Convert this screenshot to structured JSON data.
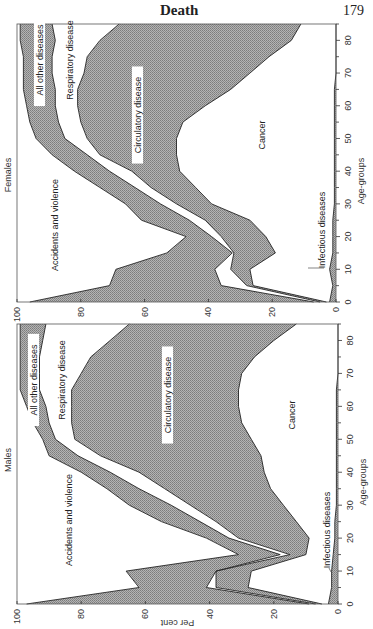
{
  "page": {
    "running_title": "Death",
    "page_number": "179"
  },
  "colors": {
    "hatch": "#9a9a9a",
    "line": "#222222",
    "background": "#ffffff"
  },
  "chart_data": [
    {
      "type": "area",
      "title": "Females",
      "xlabel": "Age-groups",
      "ylabel": "Per cent",
      "orientation": "rotated-90",
      "x_ticks": [
        0,
        10,
        20,
        30,
        40,
        50,
        60,
        70,
        80
      ],
      "y_ticks": [
        0,
        20,
        40,
        60,
        80,
        100
      ],
      "xlim": [
        0,
        85
      ],
      "ylim": [
        0,
        100
      ],
      "x": [
        0,
        5,
        10,
        15,
        20,
        25,
        30,
        35,
        40,
        45,
        50,
        55,
        60,
        65,
        70,
        75,
        80,
        85
      ],
      "stack_order_bottom_to_top": [
        "Infectious diseases",
        "Cancer",
        "Circulatory disease",
        "Respiratory disease",
        "All other diseases",
        "Accidents and violence"
      ],
      "cumulative_boundaries": [
        {
          "name": "Infectious diseases",
          "shaded": true,
          "label_pos": "bottom-callout",
          "top": [
            2,
            1,
            2,
            1,
            1,
            1,
            0.5,
            0.5,
            0.5,
            0.5,
            0.5,
            0.5,
            0.5,
            0.5,
            0,
            0,
            0,
            0
          ]
        },
        {
          "name": "Cancer",
          "shaded": false,
          "top": [
            3,
            26,
            27,
            19,
            22,
            27,
            39,
            44,
            49,
            50,
            50,
            48,
            41,
            33,
            27,
            21,
            14,
            11
          ]
        },
        {
          "name": "Circulatory disease",
          "shaded": true,
          "top": [
            5,
            28,
            33,
            32,
            36,
            41,
            50,
            58,
            64,
            74,
            78,
            80,
            81,
            81,
            79,
            78,
            74,
            68
          ]
        },
        {
          "name": "Respiratory disease",
          "shaded": false,
          "top": [
            7,
            36,
            38,
            32.5,
            39,
            46,
            55,
            63,
            71,
            78,
            85,
            87,
            88,
            88,
            89,
            89,
            88,
            89
          ]
        },
        {
          "name": "All other diseases",
          "shaded": true,
          "top": [
            96,
            71,
            69,
            53,
            47,
            61,
            66,
            74,
            82,
            89,
            94,
            96,
            97,
            98,
            98,
            98,
            99,
            99
          ]
        },
        {
          "name": "Accidents and violence",
          "shaded": false,
          "top": [
            100,
            100,
            100,
            100,
            100,
            100,
            100,
            100,
            100,
            100,
            100,
            100,
            100,
            100,
            100,
            100,
            100,
            100
          ]
        }
      ]
    },
    {
      "type": "area",
      "title": "Males",
      "xlabel": "Age-groups",
      "ylabel": "Per cent",
      "orientation": "rotated-90",
      "x_ticks": [
        0,
        10,
        20,
        30,
        40,
        50,
        60,
        70,
        80
      ],
      "y_ticks": [
        0,
        20,
        40,
        60,
        80,
        100
      ],
      "xlim": [
        0,
        85
      ],
      "ylim": [
        0,
        100
      ],
      "x": [
        0,
        5,
        10,
        15,
        20,
        25,
        30,
        35,
        40,
        45,
        50,
        55,
        60,
        65,
        70,
        75,
        80,
        85
      ],
      "stack_order_bottom_to_top": [
        "Infectious diseases",
        "Cancer",
        "Circulatory disease",
        "Respiratory disease",
        "All other diseases",
        "Accidents and violence"
      ],
      "cumulative_boundaries": [
        {
          "name": "Infectious diseases",
          "shaded": true,
          "top": [
            3,
            2,
            2,
            1.5,
            1,
            1,
            0.5,
            0.5,
            0.5,
            0.5,
            0.5,
            0.5,
            0.5,
            0.5,
            0,
            0,
            0,
            0
          ]
        },
        {
          "name": "Cancer",
          "shaded": false,
          "top": [
            5,
            28,
            27,
            10,
            9,
            13,
            17,
            21,
            23,
            24,
            27,
            30,
            31,
            31,
            30,
            26,
            20,
            13
          ]
        },
        {
          "name": "Circulatory disease",
          "shaded": true,
          "top": [
            7,
            38,
            38,
            15,
            31,
            38,
            46,
            54,
            62,
            74,
            82,
            83,
            83,
            83,
            80,
            77,
            71,
            65
          ]
        },
        {
          "name": "Respiratory disease",
          "shaded": false,
          "top": [
            9,
            41,
            38,
            18,
            34,
            43,
            52,
            62,
            71,
            81,
            88,
            90,
            91,
            93,
            93,
            93,
            92,
            91
          ]
        },
        {
          "name": "All other diseases",
          "shaded": true,
          "top": [
            97,
            62,
            66,
            31,
            41,
            55,
            65,
            72,
            80,
            90,
            92,
            95,
            97,
            99,
            99,
            99,
            99,
            99
          ]
        },
        {
          "name": "Accidents and violence",
          "shaded": false,
          "top": [
            100,
            100,
            100,
            100,
            100,
            100,
            100,
            100,
            100,
            100,
            100,
            100,
            100,
            100,
            100,
            100,
            100,
            100
          ]
        }
      ]
    }
  ]
}
